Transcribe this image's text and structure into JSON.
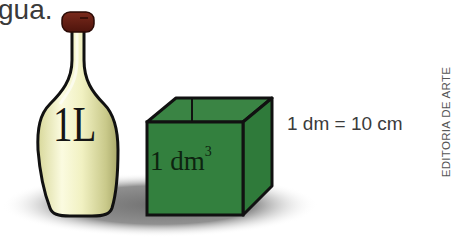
{
  "caption": {
    "partial_text": "gua."
  },
  "bottle": {
    "label": "1L",
    "cap_color": "#6b1f14",
    "body_color": "#f0f0c4"
  },
  "cube": {
    "label": "1 dm",
    "exponent": "3",
    "color": "#2f7a3a"
  },
  "equation": {
    "text": "1 dm = 10 cm"
  },
  "credit": {
    "text": "EDITORIA DE ARTE"
  }
}
